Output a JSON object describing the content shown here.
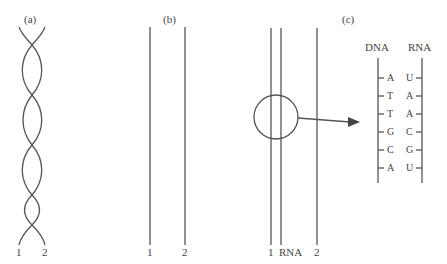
{
  "panels": {
    "a": {
      "label": "(a)",
      "strand_labels": [
        "1",
        "2"
      ]
    },
    "b": {
      "label": "(b)",
      "strand_labels": [
        "1",
        "2"
      ]
    },
    "c": {
      "label": "(c)",
      "strand_labels": [
        "1",
        "RNA",
        "2"
      ],
      "ladder": {
        "left_header": "DNA",
        "right_header": "RNA",
        "pairs": [
          {
            "dna": "A",
            "rna": "U"
          },
          {
            "dna": "T",
            "rna": "A"
          },
          {
            "dna": "T",
            "rna": "A"
          },
          {
            "dna": "G",
            "rna": "C"
          },
          {
            "dna": "C",
            "rna": "G"
          },
          {
            "dna": "A",
            "rna": "U"
          }
        ]
      }
    }
  },
  "colors": {
    "line": "#444444"
  }
}
